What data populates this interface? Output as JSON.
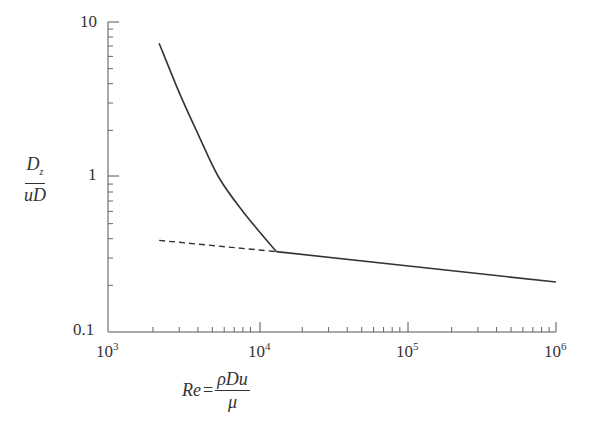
{
  "chart_data": {
    "type": "line",
    "title": "",
    "xlabel": "Re = ρDu / μ",
    "ylabel": "D_z / uD",
    "xscale": "log",
    "yscale": "log",
    "xlim": [
      1000,
      1000000
    ],
    "ylim": [
      0.1,
      10
    ],
    "x_ticks": [
      "10^3",
      "10^4",
      "10^5",
      "10^6"
    ],
    "y_ticks": [
      "0.1",
      "1",
      "10"
    ],
    "grid": false,
    "legend": null,
    "series": [
      {
        "name": "solid curve (laminar/transition)",
        "style": "solid",
        "x": [
          2200,
          3000,
          4000,
          5500,
          8000,
          13400
        ],
        "y": [
          7.3,
          3.5,
          1.9,
          1.0,
          0.6,
          0.33
        ]
      },
      {
        "name": "solid line (turbulent)",
        "style": "solid",
        "x": [
          13400,
          1000000
        ],
        "y": [
          0.33,
          0.21
        ]
      },
      {
        "name": "dashed extrapolation",
        "style": "dashed",
        "x": [
          2200,
          13400
        ],
        "y": [
          0.39,
          0.33
        ]
      }
    ]
  },
  "axes": {
    "y_labels": {
      "top": "10",
      "mid": "1",
      "bottom": "0.1"
    },
    "x_labels": {
      "e3": {
        "base": "10",
        "exp": "3"
      },
      "e4": {
        "base": "10",
        "exp": "4"
      },
      "e5": {
        "base": "10",
        "exp": "5"
      },
      "e6": {
        "base": "10",
        "exp": "6"
      }
    },
    "ylabel": {
      "num": "D",
      "num_sub": "z",
      "den": "uD"
    },
    "xlabel": {
      "lhs": "Re",
      "eq": "=",
      "num": "ρDu",
      "den": "μ"
    }
  }
}
